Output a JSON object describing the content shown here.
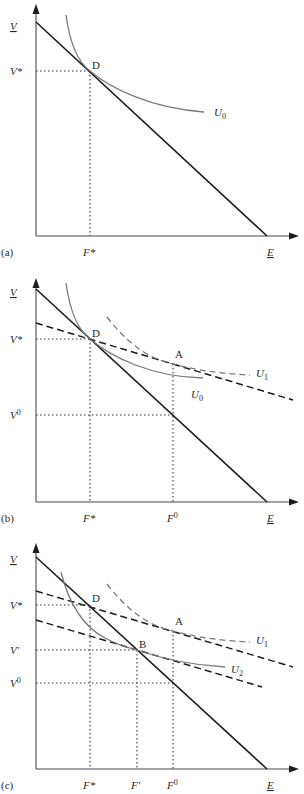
{
  "figure": {
    "panels": [
      {
        "id": "a",
        "panel_label": "(a)",
        "y_axis_label": "V",
        "x_axis_label": "E",
        "y_ticks": [
          {
            "label": "V*",
            "name": "v-star"
          }
        ],
        "x_ticks": [
          {
            "label": "F*",
            "name": "f-star"
          }
        ],
        "points": [
          {
            "label": "D",
            "name": "point-d"
          }
        ],
        "curves": [
          {
            "label": "U",
            "subscript": "0",
            "style": "solid",
            "kind": "indifference-curve"
          },
          {
            "label": "",
            "style": "solid",
            "kind": "budget-line"
          }
        ]
      },
      {
        "id": "b",
        "panel_label": "(b)",
        "y_axis_label": "V",
        "x_axis_label": "E",
        "y_ticks": [
          {
            "label": "V*",
            "name": "v-star"
          },
          {
            "label": "V",
            "sup": "0",
            "name": "v-zero"
          }
        ],
        "x_ticks": [
          {
            "label": "F*",
            "name": "f-star"
          },
          {
            "label": "F",
            "sup": "0",
            "name": "f-zero"
          }
        ],
        "points": [
          {
            "label": "D",
            "name": "point-d"
          },
          {
            "label": "A",
            "name": "point-a"
          }
        ],
        "curves": [
          {
            "label": "U",
            "subscript": "0",
            "style": "solid",
            "kind": "indifference-curve"
          },
          {
            "label": "U",
            "subscript": "1",
            "style": "dashed",
            "kind": "indifference-curve"
          },
          {
            "label": "",
            "style": "solid",
            "kind": "budget-line"
          },
          {
            "label": "",
            "style": "dashed",
            "kind": "budget-line"
          }
        ]
      },
      {
        "id": "c",
        "panel_label": "(c)",
        "y_axis_label": "V",
        "x_axis_label": "E",
        "y_ticks": [
          {
            "label": "V*",
            "name": "v-star"
          },
          {
            "label": "V′",
            "name": "v-prime"
          },
          {
            "label": "V",
            "sup": "0",
            "name": "v-zero"
          }
        ],
        "x_ticks": [
          {
            "label": "F*",
            "name": "f-star"
          },
          {
            "label": "F′",
            "name": "f-prime"
          },
          {
            "label": "F",
            "sup": "0",
            "name": "f-zero"
          }
        ],
        "points": [
          {
            "label": "D",
            "name": "point-d"
          },
          {
            "label": "A",
            "name": "point-a"
          },
          {
            "label": "B",
            "name": "point-b"
          }
        ],
        "curves": [
          {
            "label": "U",
            "subscript": "1",
            "style": "dashed",
            "kind": "indifference-curve"
          },
          {
            "label": "U",
            "subscript": "2",
            "style": "solid",
            "kind": "indifference-curve"
          },
          {
            "label": "",
            "style": "solid",
            "kind": "budget-line"
          },
          {
            "label": "",
            "style": "dashed",
            "kind": "budget-line"
          },
          {
            "label": "",
            "style": "dashed",
            "kind": "budget-line"
          }
        ]
      }
    ]
  },
  "labels": {
    "a": {
      "panel": "(a)",
      "V": "V",
      "E": "E",
      "Vstar": "V*",
      "Fstar": "F*",
      "D": "D",
      "U": "U",
      "U_sub": "0"
    },
    "b": {
      "panel": "(b)",
      "V": "V",
      "E": "E",
      "Vstar": "V*",
      "V0": "V",
      "V0_sup": "0",
      "Fstar": "F*",
      "F0": "F",
      "F0_sup": "0",
      "D": "D",
      "A": "A",
      "U0": "U",
      "U0_sub": "0",
      "U1": "U",
      "U1_sub": "1"
    },
    "c": {
      "panel": "(c)",
      "V": "V",
      "E": "E",
      "Vstar": "V*",
      "Vprime": "V′",
      "V0": "V",
      "V0_sup": "0",
      "Fstar": "F*",
      "Fprime": "F′",
      "F0": "F",
      "F0_sup": "0",
      "D": "D",
      "A": "A",
      "B": "B",
      "U1": "U",
      "U1_sub": "1",
      "U2": "U",
      "U2_sub": "2"
    }
  },
  "colors": {
    "budget_line": "#1c1c1c",
    "indifference_curve": "#7a7a7a",
    "axis": "#4a4a4a",
    "background": "#ffffff"
  }
}
